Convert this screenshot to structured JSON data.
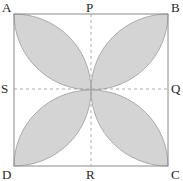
{
  "diagram": {
    "type": "geometry-figure",
    "colors": {
      "shade_fill": "#d4d4d4",
      "shade_stroke": "#9a9a9a",
      "square_stroke": "#8a8a8a",
      "dashed_line": "#9a9a9a",
      "label_color": "#1f1f1f"
    },
    "square": {
      "x": 14,
      "y": 14,
      "width": 154,
      "height": 152
    },
    "center": {
      "x": 91,
      "y": 90
    },
    "vertices": [
      {
        "name": "A",
        "label": "A",
        "position": "top-left"
      },
      {
        "name": "B",
        "label": "B",
        "position": "top-right"
      },
      {
        "name": "C",
        "label": "C",
        "position": "bottom-right"
      },
      {
        "name": "D",
        "label": "D",
        "position": "bottom-left"
      }
    ],
    "midpoints": [
      {
        "name": "P",
        "label": "P",
        "position": "top-middle"
      },
      {
        "name": "Q",
        "label": "Q",
        "position": "right-middle"
      },
      {
        "name": "R",
        "label": "R",
        "position": "bottom-middle"
      },
      {
        "name": "S",
        "label": "S",
        "position": "left-middle"
      }
    ],
    "dashed_lines": [
      {
        "from": "P",
        "to": "R"
      },
      {
        "from": "S",
        "to": "Q"
      }
    ],
    "shaded_regions": [
      {
        "quadrant": "APOS",
        "from": "A",
        "to": "center"
      },
      {
        "quadrant": "PBQO",
        "from": "B",
        "to": "center"
      },
      {
        "quadrant": "OQCR",
        "from": "C",
        "to": "center"
      },
      {
        "quadrant": "SORD",
        "from": "D",
        "to": "center"
      }
    ]
  },
  "labels": {
    "A": "A",
    "B": "B",
    "C": "C",
    "D": "D",
    "P": "P",
    "Q": "Q",
    "R": "R",
    "S": "S"
  }
}
